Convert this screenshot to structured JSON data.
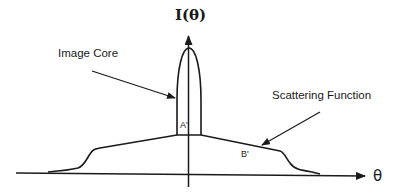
{
  "diagram": {
    "y_axis_label": "I(θ)",
    "x_axis_label": "θ",
    "annotations": {
      "image_core": "Image Core",
      "scattering_function": "Scattering Function",
      "region_a": "A'",
      "region_b": "B'"
    },
    "colors": {
      "stroke": "#1a1a1a",
      "background": "#ffffff"
    }
  }
}
